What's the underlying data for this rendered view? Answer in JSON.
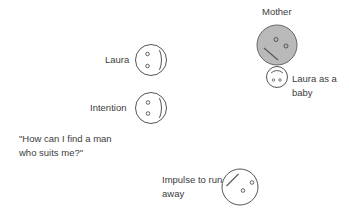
{
  "diagram": {
    "type": "face-figures",
    "colors": {
      "stroke": "#555555",
      "mother_fill": "#b9b9b9",
      "face_fill": "#ffffff",
      "text": "#3c3c3c"
    },
    "labels": {
      "laura": "Laura",
      "mother": "Mother",
      "baby_line1": "Laura as a",
      "baby_line2": "baby",
      "intention": "Intention",
      "quote_line1": "\"How can I find a man",
      "quote_line2": "who suits me?\"",
      "impulse_line1": "Impulse to run",
      "impulse_line2": "away"
    },
    "faces": [
      {
        "id": "laura",
        "label": "Laura",
        "orientation": "facing-right",
        "fill": "white"
      },
      {
        "id": "mother",
        "label": "Mother",
        "orientation": "tilted",
        "fill": "gray"
      },
      {
        "id": "baby",
        "label": "Laura as a baby",
        "orientation": "upside-down",
        "fill": "white"
      },
      {
        "id": "intention",
        "label": "Intention",
        "orientation": "facing-right",
        "fill": "white"
      },
      {
        "id": "impulse",
        "label": "Impulse to run away",
        "orientation": "tilted-away",
        "fill": "white"
      }
    ]
  }
}
